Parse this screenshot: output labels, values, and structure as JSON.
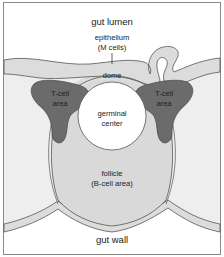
{
  "diagram": {
    "labels": {
      "gut_lumen": "gut lumen",
      "epithelium_line1": "epithelium",
      "epithelium_line2": "(M cells)",
      "dome": "dome",
      "tcell_left_line1": "T-cell",
      "tcell_left_line2": "area",
      "tcell_right_line1": "T-cell",
      "tcell_right_line2": "area",
      "germinal_line1": "germinal",
      "germinal_line2": "center",
      "follicle_line1": "follicle",
      "follicle_line2": "(B-cell area)",
      "gut_wall": "gut wall"
    },
    "colors": {
      "background": "#ffffff",
      "tissue_fill": "#eeeeee",
      "epithelium_fill": "#dcdcdc",
      "follicle_fill": "#d9d9d9",
      "tcell_fill": "#6b6b6b",
      "germinal_fill": "#ffffff",
      "outline": "#555555",
      "border": "#888888"
    }
  }
}
